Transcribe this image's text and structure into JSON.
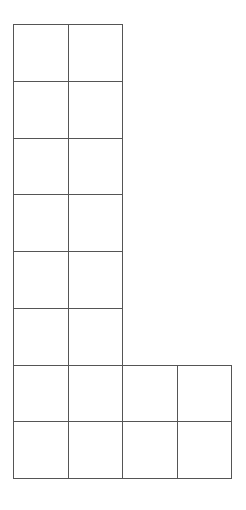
{
  "diagram": {
    "type": "L-shaped square grid",
    "line_color": "#555555",
    "background": "#ffffff",
    "origin": {
      "x": 13,
      "y": 24
    },
    "cell_width": 54.5,
    "cell_height": 56.75,
    "rows": [
      {
        "row": 0,
        "cols": 2
      },
      {
        "row": 1,
        "cols": 2
      },
      {
        "row": 2,
        "cols": 2
      },
      {
        "row": 3,
        "cols": 2
      },
      {
        "row": 4,
        "cols": 2
      },
      {
        "row": 5,
        "cols": 2
      },
      {
        "row": 6,
        "cols": 4
      },
      {
        "row": 7,
        "cols": 4
      }
    ],
    "total_cells": 20
  }
}
